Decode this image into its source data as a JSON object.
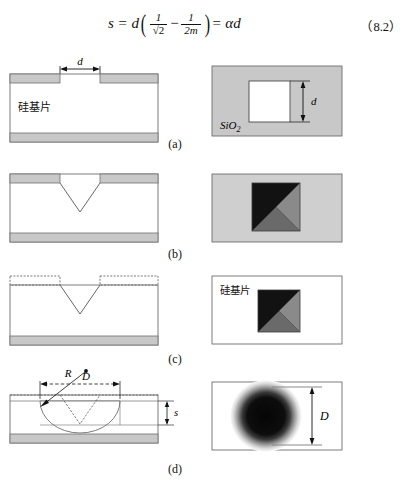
{
  "equation": {
    "lhs": "s = d",
    "frac1_num": "1",
    "frac1_den": "√2",
    "minus": "−",
    "frac2_num": "1",
    "frac2_den": "2m",
    "rhs": "= αd",
    "number": "（8.2）"
  },
  "captions": {
    "a": "(a)",
    "b": "(b)",
    "c": "(c)",
    "d": "(d)"
  },
  "labels": {
    "silicon_substrate": "硅基片",
    "silicon_dioxide": "SiO",
    "silicon_dioxide_sub": "2",
    "dim_d": "d",
    "dim_D": "D",
    "dim_R": "R",
    "dim_s": "s"
  },
  "colors": {
    "oxide_gray": "#c8c8c8",
    "oxide_gray_light": "#cfcfcf",
    "outline": "#6e6e6e",
    "dark_facet": "#121212",
    "mid_facet": "#8a8a8a",
    "mid_dark_facet": "#6a6a6a",
    "text": "#111111",
    "dash": "#555555"
  },
  "panels": [
    {
      "id": "a",
      "left_view": "cross-section with oxide mask opening of width d on silicon substrate",
      "right_view": "top view of square oxide window of side d in SiO2 film"
    },
    {
      "id": "b",
      "left_view": "cross-section after anisotropic etch forming V-groove",
      "right_view": "top view of square pyramidal pit with four facets"
    },
    {
      "id": "c",
      "left_view": "cross-section after oxide mask removal, dashed former mask outline",
      "right_view": "top view of pyramidal pit on bare silicon substrate"
    },
    {
      "id": "d",
      "left_view": "cross-section after isotropic etch, spherical cavity radius R, diameter D, undercut s",
      "right_view": "top view of circular etched region of diameter D"
    }
  ]
}
